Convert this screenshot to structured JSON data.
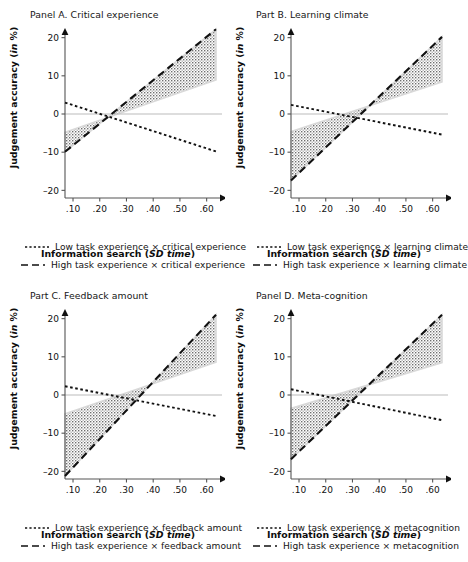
{
  "figure": {
    "width": 451,
    "height": 562,
    "axis_label_y": "Judgement accuracy (in %)",
    "axis_label_x": "Information search (SD time)",
    "y_ticks": [
      "20",
      "10",
      "0",
      "-10",
      "-20"
    ],
    "x_ticks": [
      ".10",
      ".20",
      ".30",
      ".40",
      ".50",
      ".60"
    ],
    "colors": {
      "line": "#111111",
      "band_fill": "#cfcfcf",
      "band_edge": "#d9d9d9",
      "zero_line": "#bbbbbb",
      "axis": "#555555",
      "text": "#111111"
    }
  },
  "chart_data": [
    {
      "id": "panel-a",
      "type": "line",
      "title": "Panel A. Critical experience",
      "xlabel": "Information search (SD time)",
      "ylabel": "Judgement accuracy (in %)",
      "xlim": [
        0.07,
        0.635
      ],
      "ylim": [
        -22,
        22
      ],
      "yticks": [
        20,
        10,
        0,
        -10,
        -20
      ],
      "xticks": [
        0.1,
        0.2,
        0.3,
        0.4,
        0.5,
        0.6
      ],
      "grid": false,
      "zero_line": true,
      "legend_position": "below",
      "series": [
        {
          "name": "Low task experience × critical experience",
          "style": "dotted",
          "x": [
            0.07,
            0.635
          ],
          "y": [
            3.0,
            -9.8
          ],
          "slope": -22.7,
          "intercept": 4.6
        },
        {
          "name": "High task experience × critical experience",
          "style": "dashed",
          "x": [
            0.07,
            0.635
          ],
          "y": [
            -9.9,
            22.2
          ],
          "slope": 56.8,
          "intercept": -13.9,
          "band_lower": [
            -4.8,
            8.9
          ],
          "band_upper": [
            -9.9,
            22.2
          ]
        }
      ],
      "legend": [
        {
          "label": "Low task experience × critical experience",
          "style": "dotted"
        },
        {
          "label": "High task experience × critical experience",
          "style": "dashed"
        }
      ]
    },
    {
      "id": "panel-b",
      "type": "line",
      "title": "Part B. Learning climate",
      "xlabel": "Information search (SD time)",
      "ylabel": "Judgement accuracy (in %)",
      "xlim": [
        0.07,
        0.635
      ],
      "ylim": [
        -22,
        22
      ],
      "yticks": [
        20,
        10,
        0,
        -10,
        -20
      ],
      "xticks": [
        0.1,
        0.2,
        0.3,
        0.4,
        0.5,
        0.6
      ],
      "grid": false,
      "zero_line": true,
      "legend_position": "below",
      "series": [
        {
          "name": "Low task experience × learning climate",
          "style": "dotted",
          "x": [
            0.07,
            0.635
          ],
          "y": [
            2.4,
            -5.4
          ],
          "slope": -13.8,
          "intercept": 3.4
        },
        {
          "name": "High task experience × learning climate",
          "style": "dashed",
          "x": [
            0.07,
            0.635
          ],
          "y": [
            -17.4,
            20.2
          ],
          "slope": 66.5,
          "intercept": -22.1,
          "band_lower": [
            -4.6,
            8.4
          ],
          "band_upper": [
            -17.4,
            20.2
          ]
        }
      ],
      "legend": [
        {
          "label": "Low task experience × learning climate",
          "style": "dotted"
        },
        {
          "label": "High task experience × learning climate",
          "style": "dashed"
        }
      ]
    },
    {
      "id": "panel-c",
      "type": "line",
      "title": "Part C. Feedback amount",
      "xlabel": "Information search (SD time)",
      "ylabel": "Judgement accuracy (in %)",
      "xlim": [
        0.07,
        0.635
      ],
      "ylim": [
        -22,
        22
      ],
      "yticks": [
        20,
        10,
        0,
        -10,
        -20
      ],
      "xticks": [
        0.1,
        0.2,
        0.3,
        0.4,
        0.5,
        0.6
      ],
      "grid": false,
      "zero_line": true,
      "legend_position": "below",
      "series": [
        {
          "name": "Low task experience × feedback amount",
          "style": "dotted",
          "x": [
            0.07,
            0.635
          ],
          "y": [
            2.3,
            -5.5
          ],
          "slope": -13.8,
          "intercept": 3.3
        },
        {
          "name": "High task experience × feedback amount",
          "style": "dashed",
          "x": [
            0.07,
            0.635
          ],
          "y": [
            -21.2,
            21.0
          ],
          "slope": 74.7,
          "intercept": -26.4,
          "band_lower": [
            -4.9,
            8.6
          ],
          "band_upper": [
            -21.2,
            21.0
          ]
        }
      ],
      "legend": [
        {
          "label": "Low task experience × feedback amount",
          "style": "dotted"
        },
        {
          "label": "High task experience × feedback amount",
          "style": "dashed"
        }
      ]
    },
    {
      "id": "panel-d",
      "type": "line",
      "title": "Panel D. Meta-cognition",
      "xlabel": "Information search (SD time)",
      "ylabel": "Judgement accuracy (in %)",
      "xlim": [
        0.07,
        0.635
      ],
      "ylim": [
        -22,
        22
      ],
      "yticks": [
        20,
        10,
        0,
        -10,
        -20
      ],
      "xticks": [
        0.1,
        0.2,
        0.3,
        0.4,
        0.5,
        0.6
      ],
      "grid": false,
      "zero_line": true,
      "legend_position": "below",
      "series": [
        {
          "name": "Low task experience × metacognition",
          "style": "dotted",
          "x": [
            0.07,
            0.635
          ],
          "y": [
            1.5,
            -6.6
          ],
          "slope": -14.3,
          "intercept": 2.5
        },
        {
          "name": "High task experience × metacognition",
          "style": "dashed",
          "x": [
            0.07,
            0.635
          ],
          "y": [
            -16.8,
            21.0
          ],
          "slope": 66.9,
          "intercept": -21.5,
          "band_lower": [
            -3.5,
            8.5
          ],
          "band_upper": [
            -16.8,
            21.0
          ]
        }
      ],
      "legend": [
        {
          "label": "Low task experience × metacognition",
          "style": "dotted"
        },
        {
          "label": "High task experience × metacognition",
          "style": "dashed"
        }
      ]
    }
  ]
}
